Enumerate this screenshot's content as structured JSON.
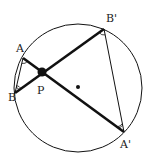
{
  "diagram": {
    "type": "intersecting-chords",
    "circle": {
      "cx": 78,
      "cy": 88,
      "r": 64,
      "center_marked": true
    },
    "points": {
      "A": {
        "label": "A",
        "x": 23,
        "y": 58
      },
      "B": {
        "label": "B",
        "x": 15,
        "y": 93
      },
      "P": {
        "label": "P",
        "x": 42,
        "y": 72
      },
      "A'": {
        "label": "A'",
        "x": 124,
        "y": 132
      },
      "B'": {
        "label": "B'",
        "x": 104,
        "y": 29
      }
    },
    "labels": {
      "A": "A",
      "B": "B",
      "P": "P",
      "A_prime": "A'",
      "B_prime": "B'"
    },
    "segments": [
      {
        "from": "A",
        "to": "A'",
        "style": "thick"
      },
      {
        "from": "B",
        "to": "B'",
        "style": "thick"
      },
      {
        "from": "A",
        "to": "B",
        "style": "thin"
      },
      {
        "from": "A'",
        "to": "B'",
        "style": "thin"
      }
    ],
    "angle_marks": [
      {
        "at": "A",
        "arcs": 1
      },
      {
        "at": "B",
        "arcs": 2
      },
      {
        "at": "A'",
        "arcs": 2
      },
      {
        "at": "B'",
        "arcs": 1
      }
    ],
    "colors": {
      "stroke": "#111111",
      "background": "#ffffff"
    }
  }
}
